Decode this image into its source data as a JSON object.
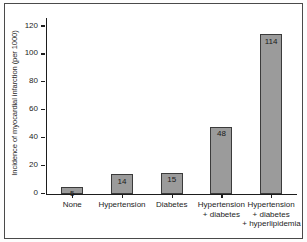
{
  "chart_data": {
    "type": "bar",
    "title": "",
    "xlabel": "",
    "ylabel": "Incidence of myocardial infarction (per 1000)",
    "categories": [
      "None",
      "Hypertension",
      "Diabetes",
      "Hypertension + diabetes",
      "Hypertension + diabetes + hyperlipidemia"
    ],
    "category_lines": [
      [
        "None"
      ],
      [
        "Hypertension"
      ],
      [
        "Diabetes"
      ],
      [
        "Hypertension",
        "+ diabetes"
      ],
      [
        "Hypertension",
        "+ diabetes",
        "+ hyperlipidemia"
      ]
    ],
    "values": [
      5,
      14,
      15,
      48,
      114
    ],
    "value_labels": [
      "5",
      "14",
      "15",
      "48",
      "114"
    ],
    "ylim": [
      0,
      120
    ],
    "yticks": [
      0,
      20,
      40,
      60,
      80,
      100,
      120
    ],
    "ytick_labels": [
      "0",
      "20",
      "40",
      "60",
      "80",
      "100",
      "120"
    ],
    "grid": false,
    "legend": null,
    "colors": {
      "bar_fill": "#9b9b9b",
      "bar_edge": "#3b3b3b",
      "axis": "#1d1d1d",
      "text": "#1d1d1d",
      "frame": "#4a4a4a",
      "plot_background": "#ffffff"
    }
  }
}
